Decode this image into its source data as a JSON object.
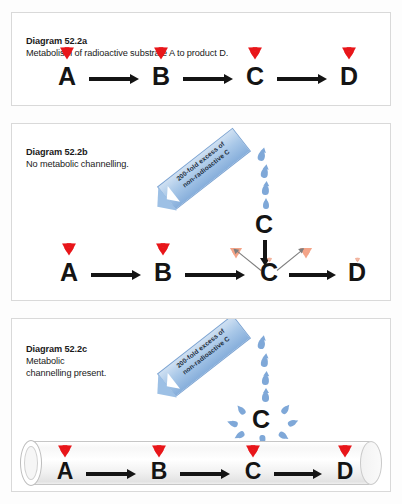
{
  "figure": {
    "id": "52.2",
    "background_color": "#fdfdfd"
  },
  "colors": {
    "radioactive_red": "#e8161a",
    "non_radioactive_pale": "#f4a488",
    "banner_blue": "#a9c8e8",
    "droplet_blue": "#7fa8d8",
    "arrow_black": "#141414",
    "panel_border": "#d9d9d9"
  },
  "panels": [
    {
      "key": "a",
      "label": "Diagram 52.2a",
      "caption": "Metabolism of radioactive substrate A to product D.",
      "chain": [
        {
          "letter": "A",
          "marker": "radioactive-trefoil",
          "marker_color": "red"
        },
        {
          "letter": "B",
          "marker": "radioactive-trefoil",
          "marker_color": "red"
        },
        {
          "letter": "C",
          "marker": "radioactive-trefoil",
          "marker_color": "red"
        },
        {
          "letter": "D",
          "marker": "radioactive-trefoil",
          "marker_color": "red"
        }
      ],
      "arrows": [
        "A-to-B",
        "B-to-C",
        "C-to-D"
      ]
    },
    {
      "key": "b",
      "label": "Diagram 52.2b",
      "caption": "No metabolic channelling.",
      "chain": [
        {
          "letter": "A",
          "marker": "radioactive-trefoil",
          "marker_color": "red"
        },
        {
          "letter": "B",
          "marker": "radioactive-trefoil",
          "marker_color": "red"
        },
        {
          "letter": "C",
          "marker": "radioactive-trefoil",
          "marker_color": "pale",
          "marker_size": "tiny"
        },
        {
          "letter": "D",
          "marker": "radioactive-trefoil",
          "marker_color": "pale",
          "marker_size": "tiny"
        }
      ],
      "arrows": [
        "A-to-B",
        "B-to-C",
        "C-to-D"
      ],
      "banner": {
        "line1": "200-fold excess of",
        "line2": "non-radioactive C"
      },
      "pour": {
        "pool_letter": "C",
        "droplet_count": 4
      },
      "dilution": {
        "left_marker": "radioactive-trefoil-pale",
        "right_marker": "radioactive-trefoil-pale",
        "down_arrow": "bulk-C-enters-pool",
        "out_arrows": 2
      }
    },
    {
      "key": "c",
      "label": "Diagram 52.2c",
      "caption": "Metabolic\nchannelling present.",
      "chain": [
        {
          "letter": "A",
          "marker": "radioactive-trefoil",
          "marker_color": "red"
        },
        {
          "letter": "B",
          "marker": "radioactive-trefoil",
          "marker_color": "red"
        },
        {
          "letter": "C",
          "marker": "radioactive-trefoil",
          "marker_color": "red"
        },
        {
          "letter": "D",
          "marker": "radioactive-trefoil",
          "marker_color": "red"
        }
      ],
      "arrows": [
        "A-to-B",
        "B-to-C",
        "C-to-D"
      ],
      "banner": {
        "line1": "200-fold excess of",
        "line2": "non-radioactive C"
      },
      "pour": {
        "pool_letter": "C",
        "droplet_count": 11
      },
      "channel": {
        "shape": "open-ended-cylinder",
        "description": "tube enclosing the A to D pathway"
      }
    }
  ]
}
